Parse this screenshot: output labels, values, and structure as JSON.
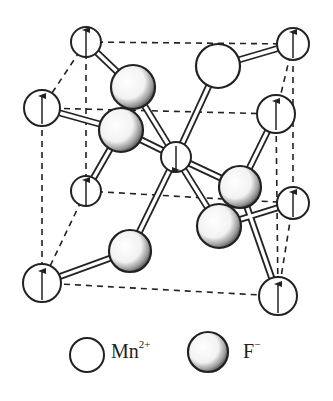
{
  "diagram": {
    "type": "crystal-structure-unit-cell"
  },
  "colors": {
    "line": "#222222",
    "background": "#ffffff",
    "shade": "#3a3a3a"
  },
  "legend": {
    "mn": {
      "symbol": "Mn",
      "charge": "2+"
    },
    "f": {
      "symbol": "F",
      "charge": "−"
    }
  },
  "atoms": {
    "mn": [
      {
        "id": "top-back-left",
        "x": 86,
        "y": 42,
        "r": 15,
        "spin": "up"
      },
      {
        "id": "top-front-left",
        "x": 42,
        "y": 108,
        "r": 18,
        "spin": "up"
      },
      {
        "id": "top-back-right",
        "x": 293,
        "y": 44,
        "r": 16,
        "spin": "up"
      },
      {
        "id": "top-front-right",
        "x": 276,
        "y": 114,
        "r": 19,
        "spin": "up"
      },
      {
        "id": "center",
        "x": 176,
        "y": 157,
        "r": 15,
        "spin": "down"
      },
      {
        "id": "bottom-back-left",
        "x": 86,
        "y": 191,
        "r": 15,
        "spin": "up"
      },
      {
        "id": "bottom-front-left",
        "x": 42,
        "y": 283,
        "r": 19,
        "spin": "up"
      },
      {
        "id": "bottom-back-right",
        "x": 293,
        "y": 203,
        "r": 16,
        "spin": "up"
      },
      {
        "id": "bottom-front-right",
        "x": 278,
        "y": 296,
        "r": 19,
        "spin": "up"
      }
    ],
    "f": [
      {
        "id": "f-top-right",
        "x": 218,
        "y": 66,
        "r": 22,
        "shaded": false
      },
      {
        "id": "f-upper-left-back",
        "x": 133,
        "y": 87,
        "r": 22,
        "shaded": true
      },
      {
        "id": "f-upper-left-front",
        "x": 121,
        "y": 130,
        "r": 22,
        "shaded": true
      },
      {
        "id": "f-lower-right-back",
        "x": 240,
        "y": 187,
        "r": 21,
        "shaded": true
      },
      {
        "id": "f-lower-right-front",
        "x": 219,
        "y": 226,
        "r": 22,
        "shaded": true
      },
      {
        "id": "f-bottom-left",
        "x": 130,
        "y": 251,
        "r": 21,
        "shaded": true
      }
    ]
  }
}
